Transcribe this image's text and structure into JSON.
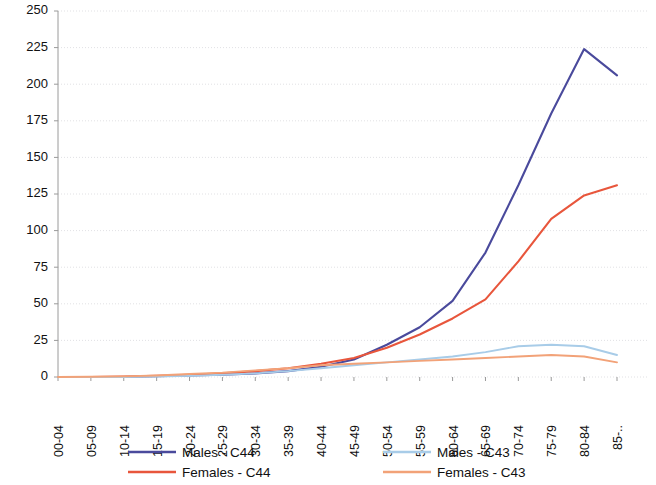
{
  "chart_data": {
    "type": "line",
    "title": "",
    "xlabel": "",
    "ylabel": "",
    "ylim": [
      0,
      250
    ],
    "yticks": [
      0,
      25,
      50,
      75,
      100,
      125,
      150,
      175,
      200,
      225,
      250
    ],
    "grid": true,
    "legend_position": "bottom",
    "categories": [
      "00-04",
      "05-09",
      "10-14",
      "15-19",
      "20-24",
      "25-29",
      "30-34",
      "35-39",
      "40-44",
      "45-49",
      "50-54",
      "55-59",
      "60-64",
      "65-69",
      "70-74",
      "75-79",
      "80-84",
      "85-.."
    ],
    "series": [
      {
        "name": "Males - C44",
        "color": "#4a4a9c",
        "values": [
          0,
          0,
          0,
          0.5,
          1,
          1.5,
          2.5,
          4,
          7,
          12,
          22,
          34,
          52,
          85,
          131,
          180,
          224,
          206
        ]
      },
      {
        "name": "Females - C44",
        "color": "#e8563c",
        "values": [
          0,
          0,
          0.3,
          0.8,
          1.5,
          2.5,
          4,
          6,
          9,
          13,
          20,
          29,
          40,
          53,
          79,
          108,
          124,
          131
        ]
      },
      {
        "name": "Males - C43",
        "color": "#a8cce8",
        "values": [
          0,
          0,
          0,
          0.3,
          0.8,
          1.5,
          2.5,
          4,
          6,
          8,
          10,
          12,
          14,
          17,
          21,
          22,
          21,
          15
        ]
      },
      {
        "name": "Females - C43",
        "color": "#f2a278",
        "values": [
          0,
          0.2,
          0.4,
          1,
          2,
          3,
          4.5,
          6,
          8,
          9,
          10,
          11,
          12,
          13,
          14,
          15,
          14,
          10
        ]
      }
    ]
  },
  "legend": {
    "entries": [
      {
        "label": "Males - C44",
        "color": "#4a4a9c"
      },
      {
        "label": "Females - C44",
        "color": "#e8563c"
      },
      {
        "label": "Males - C43",
        "color": "#a8cce8"
      },
      {
        "label": "Females - C43",
        "color": "#f2a278"
      }
    ]
  }
}
